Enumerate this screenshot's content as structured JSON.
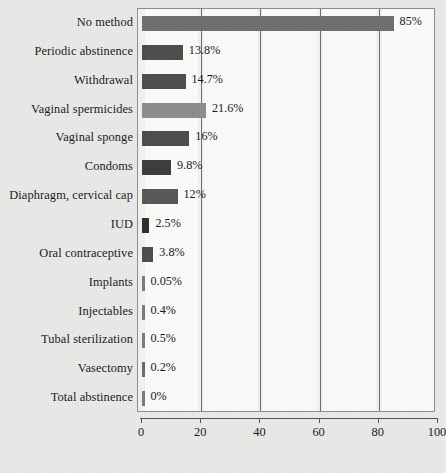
{
  "chart_data": {
    "type": "bar",
    "orientation": "horizontal",
    "title": "",
    "subtitle": "",
    "xlabel": "",
    "ylabel": "",
    "xlim": [
      0,
      100
    ],
    "grid": true,
    "legend": "none",
    "value_suffix": "%",
    "xticks": [
      {
        "value": 0,
        "label": "0"
      },
      {
        "value": 20,
        "label": "20"
      },
      {
        "value": 40,
        "label": "40"
      },
      {
        "value": 60,
        "label": "60"
      },
      {
        "value": 80,
        "label": "80"
      },
      {
        "value": 100,
        "label": "100"
      }
    ],
    "categories": [
      "No method",
      "Periodic abstinence",
      "Withdrawal",
      "Vaginal spermicides",
      "Vaginal sponge",
      "Condoms",
      "Diaphragm, cervical cap",
      "IUD",
      "Oral contraceptive",
      "Implants",
      "Injectables",
      "Tubal sterilization",
      "Vasectomy",
      "Total abstinence"
    ],
    "values": [
      85,
      13.8,
      14.7,
      21.6,
      16,
      9.8,
      12,
      2.5,
      3.8,
      0.05,
      0.4,
      0.5,
      0.2,
      0
    ],
    "value_labels": [
      "85%",
      "13.8%",
      "14.7%",
      "21.6%",
      "16%",
      "9.8%",
      "12%",
      "2.5%",
      "3.8%",
      "0.05%",
      "0.4%",
      "0.5%",
      "0.2%",
      "0%"
    ],
    "bar_colors": [
      "#6e6e6c",
      "#4c4c4a",
      "#4c4c4a",
      "#8d8d8b",
      "#4c4c4a",
      "#3b3b39",
      "#575755",
      "#2e2e2c",
      "#4c4c4a",
      "#7a7a78",
      "#7a7a78",
      "#7a7a78",
      "#6a6a68",
      "#7a7a78"
    ]
  },
  "colors": {
    "background": "#e9e9e7",
    "plot_background": "#f2f2f0",
    "band": "#fbfbfa",
    "gridline": "#6a6a68",
    "axis": "#53534f",
    "frame": "#8e8e8c",
    "text": "#16181a"
  }
}
